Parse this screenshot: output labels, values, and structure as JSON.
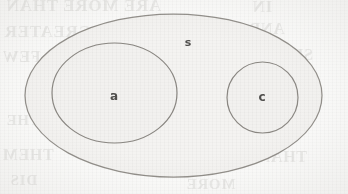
{
  "figure": {
    "kind": "euler-diagram",
    "caption": "",
    "background_color": "#fcfcfb",
    "stroke_color": "#8e8b86",
    "fill_color": "#f3f2f0",
    "label_color": "#51504e"
  },
  "regions": {
    "universe": {
      "label": "s",
      "shape": "ellipse",
      "cx": 173.5,
      "cy": 95.5,
      "rx": 148.5,
      "ry": 81.5,
      "label_x": 188,
      "label_y": 44,
      "fill": "#f4f3f1",
      "stroke": "#8e8b86"
    },
    "set_a": {
      "label": "a",
      "shape": "ellipse",
      "cx": 114.5,
      "cy": 93,
      "rx": 62.5,
      "ry": 50,
      "label_x": 114,
      "label_y": 97,
      "fill": "#f2f1ef",
      "stroke": "#8a8782"
    },
    "set_c": {
      "label": "c",
      "shape": "circle",
      "cx": 262.5,
      "cy": 97.5,
      "rx": 35.5,
      "ry": 35.5,
      "label_x": 262,
      "label_y": 98,
      "fill": "#f2f1ef",
      "stroke": "#8a8782"
    }
  },
  "bleed_through": {
    "note": "faint mirrored text showing through from the reverse side of the scanned page",
    "lines": [
      {
        "text": "ARE MORE THAN",
        "x": 6,
        "y": -4,
        "size": 17,
        "weight": 700
      },
      {
        "text": "IN",
        "x": 252,
        "y": -3,
        "size": 17,
        "weight": 700
      },
      {
        "text": "THE GREATER",
        "x": 4,
        "y": 22,
        "size": 17,
        "weight": 700
      },
      {
        "text": "AND",
        "x": 248,
        "y": 20,
        "size": 16,
        "weight": 700
      },
      {
        "text": "A FEW",
        "x": 2,
        "y": 48,
        "size": 16,
        "weight": 700
      },
      {
        "text": "OF THE",
        "x": 118,
        "y": 52,
        "size": 15,
        "weight": 700
      },
      {
        "text": "SUCCESS",
        "x": 236,
        "y": 46,
        "size": 16,
        "weight": 700
      },
      {
        "text": "NOT",
        "x": 86,
        "y": 84,
        "size": 15,
        "weight": 700
      },
      {
        "text": "TO",
        "x": 182,
        "y": 82,
        "size": 15,
        "weight": 700
      },
      {
        "text": "THERE",
        "x": 248,
        "y": 80,
        "size": 15,
        "weight": 700
      },
      {
        "text": "IN THE",
        "x": 6,
        "y": 112,
        "size": 15,
        "weight": 700
      },
      {
        "text": "OTHERS",
        "x": 120,
        "y": 118,
        "size": 15,
        "weight": 700
      },
      {
        "text": "CAN",
        "x": 268,
        "y": 116,
        "size": 15,
        "weight": 700
      },
      {
        "text": "THEM",
        "x": 2,
        "y": 146,
        "size": 16,
        "weight": 700
      },
      {
        "text": "PRESENT",
        "x": 108,
        "y": 150,
        "size": 16,
        "weight": 700
      },
      {
        "text": "THAN",
        "x": 258,
        "y": 148,
        "size": 16,
        "weight": 700
      },
      {
        "text": "DIS",
        "x": 10,
        "y": 172,
        "size": 15,
        "weight": 700
      },
      {
        "text": "MORE",
        "x": 186,
        "y": 176,
        "size": 15,
        "weight": 700
      }
    ]
  }
}
